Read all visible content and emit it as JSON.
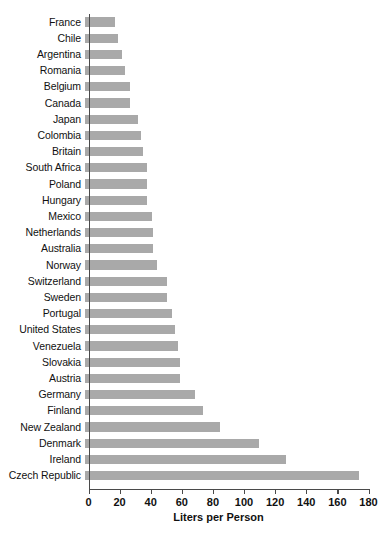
{
  "chart_data": {
    "type": "bar",
    "orientation": "horizontal",
    "title": "",
    "xlabel": "Liters per Person",
    "ylabel": "",
    "xlim": [
      0,
      180
    ],
    "xticks": [
      0,
      20,
      40,
      60,
      80,
      100,
      120,
      140,
      160,
      180
    ],
    "grid": false,
    "legend": null,
    "bar_color": "#a9a9a9",
    "axis_color": "#4a4a4a",
    "categories": [
      "France",
      "Chile",
      "Argentina",
      "Romania",
      "Belgium",
      "Canada",
      "Japan",
      "Colombia",
      "Britain",
      "South Africa",
      "Poland",
      "Hungary",
      "Mexico",
      "Netherlands",
      "Australia",
      "Norway",
      "Switzerland",
      "Sweden",
      "Portugal",
      "United States",
      "Venezuela",
      "Slovakia",
      "Austria",
      "Germany",
      "Finland",
      "New Zealand",
      "Denmark",
      "Ireland",
      "Czech Republic"
    ],
    "values": [
      19,
      21,
      24,
      26,
      29,
      29,
      34,
      36,
      37,
      40,
      40,
      40,
      43,
      44,
      44,
      46,
      53,
      53,
      56,
      58,
      60,
      61,
      61,
      71,
      76,
      87,
      112,
      129,
      176
    ]
  }
}
